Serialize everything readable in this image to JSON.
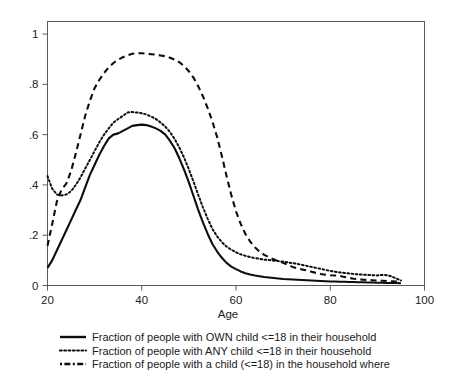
{
  "chart_data": {
    "type": "line",
    "title": "",
    "xlabel": "Age",
    "ylabel": "",
    "xlim": [
      20,
      100
    ],
    "ylim": [
      0,
      1.05
    ],
    "grid": false,
    "legend_position": "below",
    "x_ticks": [
      "20",
      "40",
      "60",
      "80",
      "100"
    ],
    "x_tick_values": [
      20,
      40,
      60,
      80,
      100
    ],
    "y_ticks": [
      "0",
      ".2",
      ".4",
      ".6",
      ".8",
      "1"
    ],
    "y_tick_values": [
      0,
      0.2,
      0.4,
      0.6,
      0.8,
      1
    ],
    "x": [
      20,
      21,
      22,
      23,
      24,
      25,
      26,
      27,
      28,
      29,
      30,
      31,
      32,
      33,
      34,
      35,
      36,
      37,
      38,
      39,
      40,
      41,
      42,
      43,
      44,
      45,
      46,
      47,
      48,
      49,
      50,
      51,
      52,
      53,
      54,
      55,
      56,
      57,
      58,
      59,
      60,
      61,
      62,
      63,
      64,
      65,
      66,
      67,
      68,
      69,
      70,
      71,
      72,
      73,
      74,
      75,
      76,
      77,
      78,
      79,
      80,
      81,
      82,
      83,
      84,
      85,
      86,
      87,
      88,
      89,
      90,
      91,
      92,
      93,
      94,
      95
    ],
    "series": [
      {
        "name": "Fraction of people with OWN child <=18 in their household",
        "style": "solid",
        "values": [
          0.07,
          0.1,
          0.14,
          0.18,
          0.22,
          0.26,
          0.3,
          0.34,
          0.39,
          0.44,
          0.48,
          0.52,
          0.555,
          0.585,
          0.6,
          0.605,
          0.615,
          0.625,
          0.635,
          0.638,
          0.64,
          0.638,
          0.632,
          0.625,
          0.615,
          0.6,
          0.575,
          0.545,
          0.505,
          0.46,
          0.41,
          0.355,
          0.3,
          0.25,
          0.205,
          0.165,
          0.135,
          0.11,
          0.09,
          0.075,
          0.065,
          0.056,
          0.049,
          0.044,
          0.04,
          0.037,
          0.034,
          0.032,
          0.03,
          0.028,
          0.026,
          0.025,
          0.024,
          0.023,
          0.022,
          0.021,
          0.02,
          0.019,
          0.018,
          0.017,
          0.016,
          0.016,
          0.015,
          0.015,
          0.014,
          0.014,
          0.013,
          0.013,
          0.012,
          0.012,
          0.011,
          0.011,
          0.01,
          0.01,
          0.01,
          0.009
        ]
      },
      {
        "name": "Fraction of people with ANY child <=18 in their household",
        "style": "dotted",
        "values": [
          0.435,
          0.385,
          0.362,
          0.358,
          0.362,
          0.375,
          0.4,
          0.43,
          0.465,
          0.5,
          0.535,
          0.57,
          0.6,
          0.625,
          0.648,
          0.662,
          0.675,
          0.688,
          0.69,
          0.688,
          0.685,
          0.68,
          0.672,
          0.662,
          0.648,
          0.632,
          0.61,
          0.582,
          0.548,
          0.508,
          0.462,
          0.412,
          0.36,
          0.31,
          0.265,
          0.225,
          0.195,
          0.172,
          0.155,
          0.142,
          0.132,
          0.124,
          0.118,
          0.113,
          0.109,
          0.106,
          0.103,
          0.101,
          0.099,
          0.097,
          0.095,
          0.092,
          0.089,
          0.086,
          0.082,
          0.078,
          0.074,
          0.07,
          0.066,
          0.062,
          0.058,
          0.055,
          0.052,
          0.05,
          0.048,
          0.046,
          0.044,
          0.043,
          0.042,
          0.041,
          0.04,
          0.042,
          0.041,
          0.036,
          0.028,
          0.02
        ]
      },
      {
        "name": "Fraction of people with a child (<=18) in the household where",
        "style": "dashed",
        "values": [
          0.158,
          0.245,
          0.335,
          0.382,
          0.405,
          0.455,
          0.525,
          0.6,
          0.675,
          0.735,
          0.785,
          0.818,
          0.845,
          0.868,
          0.885,
          0.898,
          0.908,
          0.916,
          0.922,
          0.924,
          0.924,
          0.922,
          0.92,
          0.918,
          0.915,
          0.912,
          0.906,
          0.898,
          0.888,
          0.872,
          0.852,
          0.826,
          0.792,
          0.752,
          0.705,
          0.652,
          0.59,
          0.515,
          0.435,
          0.36,
          0.295,
          0.245,
          0.205,
          0.175,
          0.152,
          0.135,
          0.122,
          0.112,
          0.104,
          0.097,
          0.09,
          0.082,
          0.074,
          0.068,
          0.064,
          0.06,
          0.055,
          0.05,
          0.046,
          0.043,
          0.041,
          0.04,
          0.038,
          0.034,
          0.03,
          0.027,
          0.025,
          0.023,
          0.022,
          0.021,
          0.02,
          0.019,
          0.018,
          0.017,
          0.016,
          0.014
        ]
      }
    ],
    "legend_entries": [
      {
        "label": "Fraction of people with OWN child <=18 in their household",
        "style": "solid"
      },
      {
        "label": "Fraction of people with ANY child <=18 in their household",
        "style": "dotted"
      },
      {
        "label": "Fraction of people with a child (<=18) in the household where",
        "style": "dashed"
      }
    ]
  }
}
